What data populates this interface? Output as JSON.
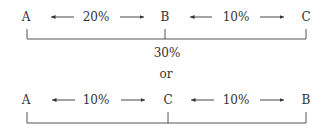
{
  "diagram": {
    "top": {
      "points": [
        "A",
        "B",
        "C"
      ],
      "segments": [
        "20%",
        "10%"
      ],
      "total": "30%"
    },
    "connector": "or",
    "bottom": {
      "points": [
        "A",
        "C",
        "B"
      ],
      "segments": [
        "10%",
        "10%"
      ]
    }
  }
}
